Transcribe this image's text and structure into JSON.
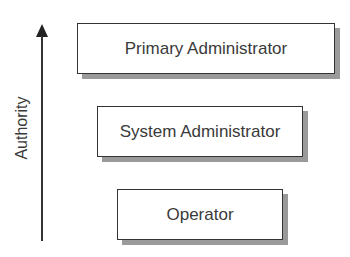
{
  "axis": {
    "label": "Authority",
    "direction": "up"
  },
  "levels": [
    {
      "label": "Primary Administrator",
      "rank": 1
    },
    {
      "label": "System Administrator",
      "rank": 2
    },
    {
      "label": "Operator",
      "rank": 3
    }
  ]
}
